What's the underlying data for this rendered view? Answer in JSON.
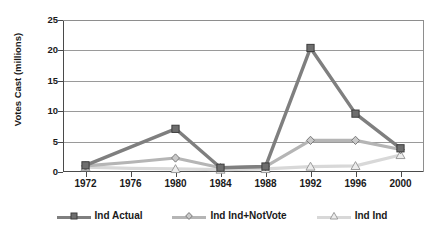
{
  "chart_data": {
    "type": "line",
    "title": "",
    "xlabel": "",
    "ylabel": "Votes Cast (millions)",
    "categories": [
      "1972",
      "1976",
      "1980",
      "1984",
      "1988",
      "1992",
      "1996",
      "2000"
    ],
    "ylim": [
      0,
      25
    ],
    "yticks": [
      0,
      5,
      10,
      15,
      20,
      25
    ],
    "grid": true,
    "legend_position": "bottom",
    "series": [
      {
        "name": "Ind Actual",
        "marker": "square",
        "color": "#7f7f7f",
        "values": [
          1.1,
          4.1,
          7.1,
          0.7,
          0.9,
          20.4,
          9.6,
          3.9
        ],
        "marker_at": [
          true,
          false,
          true,
          true,
          true,
          true,
          true,
          true
        ]
      },
      {
        "name": "Ind Ind+NotVote",
        "marker": "diamond",
        "color": "#b5b5b5",
        "values": [
          1.0,
          1.6,
          2.3,
          0.7,
          0.9,
          5.2,
          5.2,
          3.7
        ],
        "marker_at": [
          true,
          false,
          true,
          true,
          true,
          true,
          true,
          true
        ]
      },
      {
        "name": "Ind Ind",
        "marker": "triangle",
        "color": "#d8d8d8",
        "values": [
          0.8,
          0.6,
          0.5,
          0.4,
          0.5,
          0.9,
          1.0,
          2.8
        ],
        "marker_at": [
          true,
          false,
          true,
          true,
          true,
          true,
          true,
          true
        ]
      }
    ]
  },
  "axis": {
    "y_label_text": "Votes Cast (millions)",
    "y_tick_labels": [
      "25",
      "20",
      "15",
      "10",
      "5",
      "0"
    ],
    "x_tick_labels": [
      "1972",
      "1976",
      "1980",
      "1984",
      "1988",
      "1992",
      "1996",
      "2000"
    ]
  },
  "legend": {
    "items": [
      {
        "label": "Ind Actual"
      },
      {
        "label": "Ind Ind+NotVote"
      },
      {
        "label": "Ind Ind"
      }
    ]
  },
  "colors": {
    "series_1": "#7f7f7f",
    "series_2": "#b5b5b5",
    "series_3": "#d8d8d8",
    "axis": "#4a4a4a",
    "grid": "#9a9a9a",
    "text": "#1a1a1a",
    "background": "#ffffff"
  }
}
